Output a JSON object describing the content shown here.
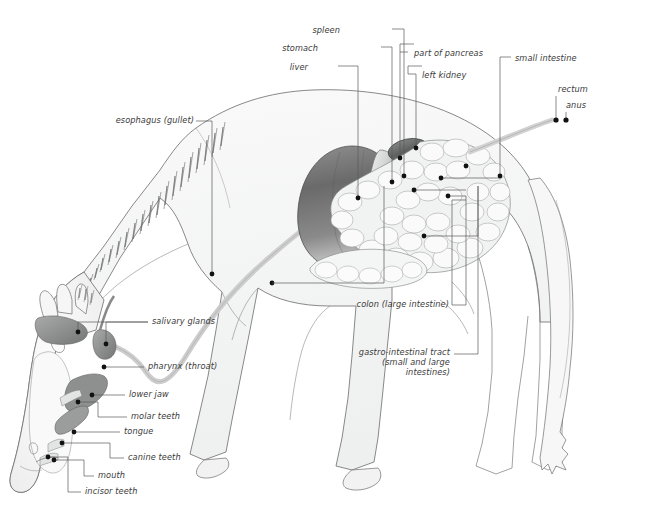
{
  "diagram": {
    "background_color": "#ffffff",
    "line_color": "#5a5a5a",
    "label_color": "#3a3a3a",
    "marker_color": "#111111",
    "body_fill": "#f4f5f5",
    "organ_dark": "#6e6e6e",
    "organ_mid": "#a8a8a8",
    "organ_light": "#e8e9e9"
  },
  "labels": [
    {
      "id": "liver",
      "text": "liver",
      "align": "right",
      "x": 308,
      "y": 68,
      "w": 50
    },
    {
      "id": "stomach",
      "text": "stomach",
      "align": "right",
      "x": 318,
      "y": 49,
      "w": 60
    },
    {
      "id": "spleen",
      "text": "spleen",
      "align": "right",
      "x": 340,
      "y": 31,
      "w": 48
    },
    {
      "id": "part-of-pancreas",
      "text": "part of pancreas",
      "align": "left",
      "x": 412,
      "y": 54,
      "w": 96
    },
    {
      "id": "left-kidney",
      "text": "left kidney",
      "align": "left",
      "x": 420,
      "y": 76,
      "w": 70
    },
    {
      "id": "small-intestine",
      "text": "small intestine",
      "align": "left",
      "x": 515,
      "y": 59,
      "w": 90
    },
    {
      "id": "rectum",
      "text": "rectum",
      "align": "left",
      "x": 558,
      "y": 88,
      "w": 48
    },
    {
      "id": "anus",
      "text": "anus",
      "align": "left",
      "x": 566,
      "y": 104,
      "w": 40
    },
    {
      "id": "esophagus",
      "text": "esophagus (gullet)",
      "align": "right",
      "x": 91,
      "y": 120,
      "w": 104
    },
    {
      "id": "salivary-glands",
      "text": "salivary glands",
      "align": "left",
      "x": 152,
      "y": 319,
      "w": 90
    },
    {
      "id": "pharynx",
      "text": "pharynx (throat)",
      "align": "left",
      "x": 148,
      "y": 364,
      "w": 96
    },
    {
      "id": "lower-jaw",
      "text": "lower jaw",
      "align": "left",
      "x": 129,
      "y": 392,
      "w": 62
    },
    {
      "id": "molar-teeth",
      "text": "molar teeth",
      "align": "left",
      "x": 131,
      "y": 414,
      "w": 70
    },
    {
      "id": "tongue",
      "text": "tongue",
      "align": "left",
      "x": 124,
      "y": 429,
      "w": 48
    },
    {
      "id": "canine-teeth",
      "text": "canine teeth",
      "align": "left",
      "x": 128,
      "y": 455,
      "w": 74
    },
    {
      "id": "mouth",
      "text": "mouth",
      "align": "left",
      "x": 98,
      "y": 473,
      "w": 46
    },
    {
      "id": "incisor-teeth",
      "text": "incisor teeth",
      "align": "left",
      "x": 85,
      "y": 489,
      "w": 76
    },
    {
      "id": "colon",
      "text": "colon (large intestine)",
      "align": "right",
      "x": 329,
      "y": 303,
      "w": 120
    },
    {
      "id": "gi-tract-1",
      "text": "gastro-intestinal tract",
      "align": "right",
      "x": 334,
      "y": 351,
      "w": 116
    },
    {
      "id": "gi-tract-2",
      "text": "(small and large",
      "align": "right",
      "x": 334,
      "y": 361,
      "w": 116
    },
    {
      "id": "gi-tract-3",
      "text": "intestines)",
      "align": "right",
      "x": 334,
      "y": 371,
      "w": 116
    }
  ],
  "organs": [
    {
      "id": "liver",
      "name": "liver"
    },
    {
      "id": "stomach",
      "name": "stomach"
    },
    {
      "id": "spleen",
      "name": "spleen"
    },
    {
      "id": "pancreas",
      "name": "part of pancreas"
    },
    {
      "id": "left-kidney",
      "name": "left kidney"
    },
    {
      "id": "small-intestine",
      "name": "small intestine"
    },
    {
      "id": "large-intestine",
      "name": "colon (large intestine)"
    },
    {
      "id": "rectum",
      "name": "rectum"
    },
    {
      "id": "esophagus",
      "name": "esophagus (gullet)"
    },
    {
      "id": "salivary-glands",
      "name": "salivary glands"
    },
    {
      "id": "pharynx",
      "name": "pharynx (throat)"
    },
    {
      "id": "tongue",
      "name": "tongue"
    },
    {
      "id": "teeth",
      "name": "teeth"
    }
  ]
}
